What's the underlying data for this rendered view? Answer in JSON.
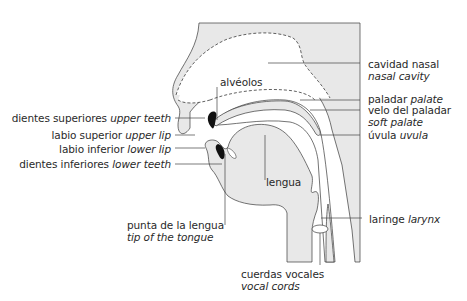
{
  "diagram": {
    "type": "anatomical-cross-section",
    "colors": {
      "fill": "#e8e8e8",
      "stroke": "#3a3a3a",
      "teeth": "#111111",
      "text": "#2a2a2a",
      "background": "#ffffff"
    }
  },
  "labels": {
    "alveolos": {
      "es": "alvéolos"
    },
    "upper_teeth": {
      "es": "dientes superiores",
      "en": "upper teeth"
    },
    "upper_lip": {
      "es": "labio superior",
      "en": "upper lip"
    },
    "lower_lip": {
      "es": "labio inferior",
      "en": "lower lip"
    },
    "lower_teeth": {
      "es": "dientes inferiores",
      "en": "lower teeth"
    },
    "tip_tongue": {
      "es": "punta de la lengua",
      "en": "tip of the tongue"
    },
    "tongue": {
      "es": "lengua"
    },
    "vocal_cords": {
      "es": "cuerdas vocales",
      "en": "vocal cords"
    },
    "nasal_cavity": {
      "es": "cavidad nasal",
      "en": "nasal cavity"
    },
    "palate": {
      "es": "paladar",
      "en": "palate"
    },
    "soft_palate": {
      "es": "velo del paladar",
      "en": "soft palate"
    },
    "uvula": {
      "es": "úvula",
      "en": "uvula"
    },
    "larynx": {
      "es": "laringe",
      "en": "larynx"
    }
  }
}
